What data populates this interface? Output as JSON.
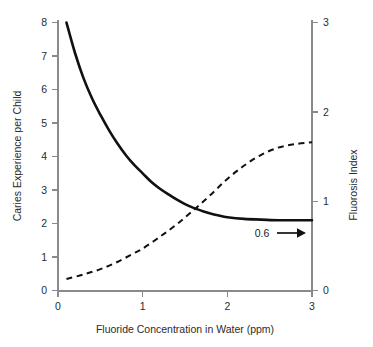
{
  "chart_data": {
    "type": "line",
    "title": "",
    "subtitle": "",
    "xlabel": "Fluoride Concentration in Water (ppm)",
    "ylabel": "Caries Experience per Child",
    "y2label": "Fluorosis Index",
    "xlim": [
      0,
      3
    ],
    "ylim": [
      0,
      8
    ],
    "y2lim": [
      0,
      3
    ],
    "grid": false,
    "legend": "none",
    "xticks": [
      "0",
      "1",
      "2",
      "3"
    ],
    "xtick_values": [
      0,
      1,
      2,
      3
    ],
    "yticks": [
      "0",
      "1",
      "2",
      "3",
      "4",
      "5",
      "6",
      "7",
      "8"
    ],
    "ytick_values": [
      0,
      1,
      2,
      3,
      4,
      5,
      6,
      7,
      8
    ],
    "y2ticks": [
      "0",
      "1",
      "2",
      "3"
    ],
    "y2tick_values": [
      0,
      1,
      2,
      3
    ],
    "series": [
      {
        "name": "Caries Experience per Child",
        "axis": "left",
        "style": "solid",
        "x": [
          0.1,
          0.2,
          0.3,
          0.4,
          0.5,
          0.6,
          0.7,
          0.8,
          0.9,
          1.0,
          1.1,
          1.2,
          1.3,
          1.4,
          1.5,
          1.6,
          1.7,
          1.8,
          1.9,
          2.0,
          2.2,
          2.4,
          2.6,
          2.8,
          3.0
        ],
        "values": [
          8.0,
          7.1,
          6.35,
          5.75,
          5.25,
          4.8,
          4.4,
          4.05,
          3.75,
          3.5,
          3.25,
          3.05,
          2.88,
          2.72,
          2.58,
          2.47,
          2.38,
          2.3,
          2.24,
          2.19,
          2.14,
          2.12,
          2.1,
          2.1,
          2.1
        ]
      },
      {
        "name": "Fluorosis Index",
        "axis": "right",
        "style": "dashed",
        "x": [
          0.1,
          0.3,
          0.5,
          0.7,
          0.9,
          1.0,
          1.2,
          1.4,
          1.6,
          1.8,
          2.0,
          2.2,
          2.4,
          2.6,
          2.8,
          3.0
        ],
        "values": [
          0.13,
          0.18,
          0.24,
          0.32,
          0.42,
          0.47,
          0.6,
          0.74,
          0.9,
          1.07,
          1.25,
          1.4,
          1.52,
          1.6,
          1.64,
          1.66
        ]
      }
    ],
    "annotations": [
      {
        "name": "fluorosis-threshold-callout",
        "text": "0.6",
        "arrow": "right",
        "x": 2.35,
        "y_left": 1.55
      }
    ]
  },
  "colors": {
    "background": "#ffffff",
    "axis": "#8a8a8a",
    "text": "#2b2b2b",
    "series": "#111111"
  }
}
